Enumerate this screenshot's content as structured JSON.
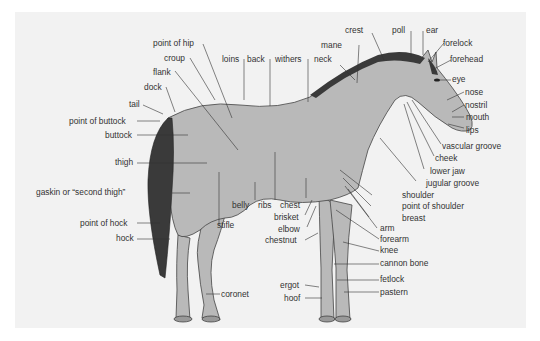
{
  "diagram": {
    "title": "",
    "colors": {
      "background": "#ffffff",
      "panel": "#f2f2f2",
      "body": "#b9b9b9",
      "mane_tail": "#3a3a3a",
      "line": "#333333",
      "text": "#333333"
    },
    "labels": {
      "point_of_hip": "point of hip",
      "croup": "croup",
      "flank": "flank",
      "dock": "dock",
      "tail": "tail",
      "point_of_buttock": "point of buttock",
      "buttock": "buttock",
      "thigh": "thigh",
      "gaskin": "gaskin or “second thigh”",
      "point_of_hock": "point of hock",
      "hock": "hock",
      "stifle": "stifle",
      "coronet": "coronet",
      "loins": "loins",
      "back": "back",
      "withers": "withers",
      "neck": "neck",
      "mane": "mane",
      "crest": "crest",
      "poll": "poll",
      "ear": "ear",
      "forelock": "forelock",
      "forehead": "forehead",
      "eye": "eye",
      "nose": "nose",
      "nostril": "nostril",
      "mouth": "mouth",
      "lips": "lips",
      "vascular_groove": "vascular groove",
      "cheek": "cheek",
      "lower_jaw": "lower jaw",
      "jugular_groove": "jugular groove",
      "shoulder": "shoulder",
      "point_of_shoulder": "point of shoulder",
      "breast": "breast",
      "belly": "belly",
      "ribs": "ribs",
      "chest": "chest",
      "brisket": "brisket",
      "elbow": "elbow",
      "chestnut": "chestnut",
      "arm": "arm",
      "forearm": "forearm",
      "knee": "knee",
      "cannon_bone": "cannon bone",
      "fetlock": "fetlock",
      "pastern": "pastern",
      "ergot": "ergot",
      "hoof": "hoof"
    }
  }
}
